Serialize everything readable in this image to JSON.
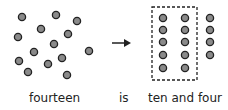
{
  "colors": {
    "dot_fill": "#8a8a8a",
    "dot_stroke": "#222222",
    "line": "#222222"
  },
  "scattered_dots": [
    [
      22,
      17
    ],
    [
      56,
      15
    ],
    [
      77,
      21
    ],
    [
      41,
      29
    ],
    [
      18,
      37
    ],
    [
      68,
      34
    ],
    [
      54,
      44
    ],
    [
      89,
      51
    ],
    [
      34,
      52
    ],
    [
      19,
      61
    ],
    [
      62,
      58
    ],
    [
      48,
      64
    ],
    [
      28,
      72
    ],
    [
      67,
      75
    ]
  ],
  "grouped_dots": {
    "ten_group": [
      [
        163,
        18
      ],
      [
        163,
        30
      ],
      [
        163,
        42
      ],
      [
        163,
        55
      ],
      [
        163,
        68
      ],
      [
        185,
        18
      ],
      [
        185,
        30
      ],
      [
        185,
        42
      ],
      [
        185,
        55
      ],
      [
        185,
        68
      ]
    ],
    "ones": [
      [
        210,
        18
      ],
      [
        210,
        30
      ],
      [
        210,
        42
      ],
      [
        210,
        55
      ]
    ]
  },
  "labels": {
    "left": "fourteen",
    "middle": "is",
    "right": "ten and four"
  }
}
